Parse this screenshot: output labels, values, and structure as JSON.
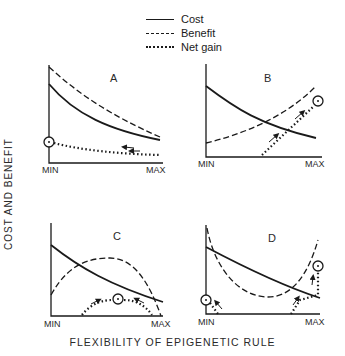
{
  "legend": {
    "items": [
      {
        "label": "Cost",
        "style": "solid"
      },
      {
        "label": "Benefit",
        "style": "dashed"
      },
      {
        "label": "Net gain",
        "style": "dotted"
      }
    ]
  },
  "axes": {
    "y_label": "COST AND BENEFIT",
    "x_label": "FLEXIBILITY OF EPIGENETIC RULE",
    "x_min": "MIN",
    "x_max": "MAX"
  },
  "panels": [
    {
      "id": "A",
      "label": "A",
      "description": "Cost and benefit both decline with flexibility; net gain maximal at MIN"
    },
    {
      "id": "B",
      "label": "B",
      "description": "Cost declines, benefit rises; net gain maximal at MAX"
    },
    {
      "id": "C",
      "label": "C",
      "description": "Cost declines, benefit peaks at intermediate; net gain maximal at intermediate"
    },
    {
      "id": "D",
      "label": "D",
      "description": "Cost declines, benefit U-shaped; net gain maximal at MIN and MAX"
    }
  ],
  "colors": {
    "ink": "#1a1a1a",
    "background": "#ffffff"
  }
}
